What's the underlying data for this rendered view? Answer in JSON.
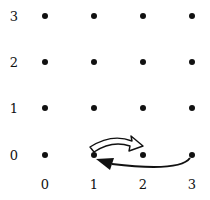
{
  "diagram": {
    "type": "lattice_grid",
    "x_labels": [
      "0",
      "1",
      "2",
      "3"
    ],
    "y_labels": [
      "0",
      "1",
      "2",
      "3"
    ],
    "points": "4x4 grid of dots at integer coordinates (0..3, 0..3)",
    "arrows": [
      {
        "style": "hollow outlined arrow",
        "from": [
          1,
          0
        ],
        "to": [
          2,
          0
        ],
        "curve": "arcs above"
      },
      {
        "style": "solid filled arrow",
        "from": [
          3,
          0
        ],
        "to": [
          1,
          0
        ],
        "curve": "arcs below"
      }
    ]
  }
}
